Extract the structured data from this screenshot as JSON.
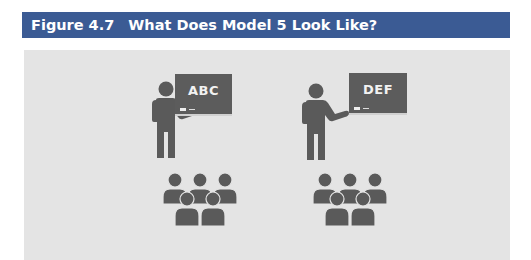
{
  "figure": {
    "number": "Figure 4.7",
    "title": "What Does Model 5 Look Like?",
    "header_color": "#3b5b94",
    "panel_color": "#e4e4e4"
  },
  "scenes": [
    {
      "board_text": "ABC",
      "teacher_icon": "teacher-icon",
      "students_icon": "students-group-icon",
      "student_count": 5
    },
    {
      "board_text": "DEF",
      "teacher_icon": "teacher-icon",
      "students_icon": "students-group-icon",
      "student_count": 5
    }
  ]
}
